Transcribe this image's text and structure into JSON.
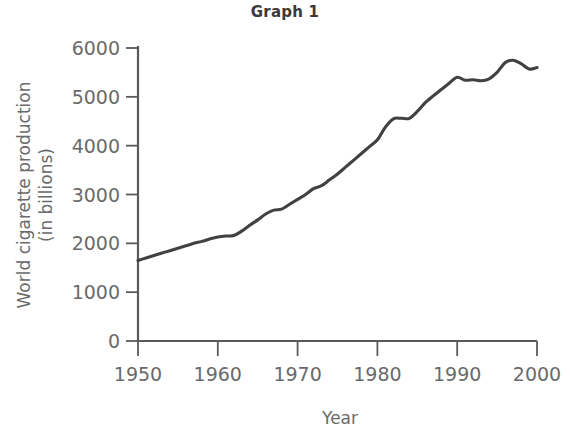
{
  "chart_data": {
    "type": "line",
    "title": "Graph 1",
    "xlabel": "Year",
    "ylabel": "World cigarette production (in billions)",
    "ylabel_line1": "World cigarette production",
    "ylabel_line2": "(in billions)",
    "xlim": [
      1950,
      2000
    ],
    "ylim": [
      0,
      6000
    ],
    "xticks": [
      1950,
      1960,
      1970,
      1980,
      1990,
      2000
    ],
    "xtick_labels": [
      "1950",
      "1960",
      "1970",
      "1980",
      "1990",
      "2000"
    ],
    "yticks": [
      0,
      1000,
      2000,
      3000,
      4000,
      5000,
      6000
    ],
    "ytick_labels": [
      "0",
      "1000",
      "2000",
      "3000",
      "4000",
      "5000",
      "6000"
    ],
    "grid": false,
    "legend": null,
    "line_color": "#414141",
    "axis_color": "#5a5a5a",
    "series": [
      {
        "name": "World cigarette production",
        "x": [
          1950,
          1951,
          1952,
          1953,
          1954,
          1955,
          1956,
          1957,
          1958,
          1959,
          1960,
          1961,
          1962,
          1963,
          1964,
          1965,
          1966,
          1967,
          1968,
          1969,
          1970,
          1971,
          1972,
          1973,
          1974,
          1975,
          1976,
          1977,
          1978,
          1979,
          1980,
          1981,
          1982,
          1983,
          1984,
          1985,
          1986,
          1987,
          1988,
          1989,
          1990,
          1991,
          1992,
          1993,
          1994,
          1995,
          1996,
          1997,
          1998,
          1999,
          2000
        ],
        "values": [
          1650,
          1700,
          1750,
          1800,
          1850,
          1900,
          1950,
          2000,
          2040,
          2090,
          2130,
          2150,
          2160,
          2250,
          2370,
          2480,
          2600,
          2680,
          2700,
          2800,
          2900,
          3000,
          3120,
          3180,
          3300,
          3420,
          3560,
          3700,
          3840,
          3980,
          4120,
          4380,
          4550,
          4560,
          4560,
          4700,
          4880,
          5020,
          5150,
          5280,
          5400,
          5340,
          5350,
          5330,
          5370,
          5500,
          5700,
          5750,
          5680,
          5570,
          5600
        ]
      }
    ]
  },
  "axis_labels": {
    "y": [
      "6000",
      "5000",
      "4000",
      "3000",
      "2000",
      "1000",
      "0"
    ],
    "x": [
      "1950",
      "1960",
      "1970",
      "1980",
      "1990",
      "2000"
    ]
  }
}
